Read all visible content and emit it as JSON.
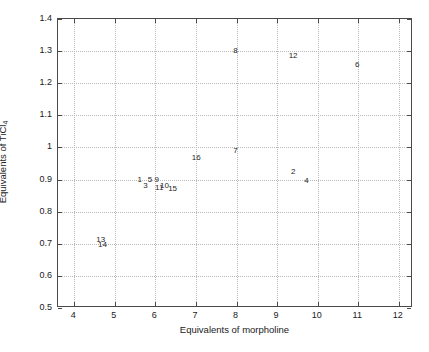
{
  "chart_data": {
    "type": "scatter",
    "title": "",
    "xlabel": "Equivalents of morpholine",
    "ylabel": "Equivalents of TiCl",
    "ylabel_sub": "4",
    "xlim": [
      3.6,
      12.35
    ],
    "ylim": [
      0.5,
      1.4
    ],
    "xticks": [
      4,
      5,
      6,
      7,
      8,
      9,
      10,
      11,
      12
    ],
    "yticks": [
      0.5,
      0.6,
      0.7,
      0.8,
      0.9,
      1,
      1.1,
      1.2,
      1.3,
      1.4
    ],
    "xticklabels": [
      "4",
      "5",
      "6",
      "7",
      "8",
      "9",
      "10",
      "11",
      "12"
    ],
    "yticklabels": [
      "0.5",
      "0.6",
      "0.7",
      "0.8",
      "0.9",
      "1",
      "1.1",
      "1.2",
      "1.3",
      "1.4"
    ],
    "grid": true,
    "grid_style": "dotted",
    "grid_color": "#b9b9b9",
    "axis_color": "#4a4a4a",
    "marker_style": "text-label",
    "legend": null,
    "points": [
      {
        "label": "8",
        "x": 8.0,
        "y": 1.3
      },
      {
        "label": "12",
        "x": 9.42,
        "y": 1.285
      },
      {
        "label": "6",
        "x": 11.0,
        "y": 1.258
      },
      {
        "label": "7",
        "x": 8.0,
        "y": 0.99
      },
      {
        "label": "16",
        "x": 7.03,
        "y": 0.968
      },
      {
        "label": "2",
        "x": 9.42,
        "y": 0.925
      },
      {
        "label": "4",
        "x": 9.75,
        "y": 0.895
      },
      {
        "label": "1",
        "x": 5.64,
        "y": 0.9
      },
      {
        "label": "5",
        "x": 5.89,
        "y": 0.9
      },
      {
        "label": "9",
        "x": 6.06,
        "y": 0.9
      },
      {
        "label": "3",
        "x": 5.78,
        "y": 0.88
      },
      {
        "label": "11",
        "x": 6.12,
        "y": 0.875
      },
      {
        "label": "10",
        "x": 6.25,
        "y": 0.88
      },
      {
        "label": "15",
        "x": 6.45,
        "y": 0.87
      },
      {
        "label": "13",
        "x": 4.68,
        "y": 0.712
      },
      {
        "label": "14",
        "x": 4.72,
        "y": 0.697
      }
    ]
  }
}
